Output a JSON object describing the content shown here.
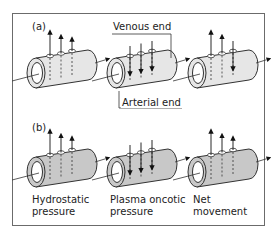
{
  "panels": [
    {
      "label": "(a)",
      "fill": "#e6e6e6",
      "cylinders": [
        {
          "name": "hydrostatic",
          "arrows": [
            "up-long",
            "up-mid",
            "up-short"
          ]
        },
        {
          "name": "oncotic",
          "arrows": [
            "down",
            "down",
            "down"
          ]
        },
        {
          "name": "net",
          "arrows": [
            "up-long",
            "up-mid",
            "down"
          ]
        }
      ]
    },
    {
      "label": "(b)",
      "fill": "#c8c8c8",
      "cylinders": [
        {
          "name": "hydrostatic",
          "arrows": [
            "up-long",
            "up-mid",
            "up-short"
          ]
        },
        {
          "name": "oncotic",
          "arrows": [
            "down",
            "down",
            "down"
          ]
        },
        {
          "name": "net",
          "arrows": [
            "up-long",
            "up-mid",
            "up-short"
          ]
        }
      ]
    }
  ],
  "callouts": {
    "venous_end": "Venous end",
    "arterial_end": "Arterial end"
  },
  "captions": {
    "hydrostatic": "Hydrostatic\npressure",
    "oncotic": "Plasma oncotic\npressure",
    "net": "Net\nmovement"
  },
  "colors": {
    "stroke": "#333333",
    "frame": "#6b6b6b"
  }
}
